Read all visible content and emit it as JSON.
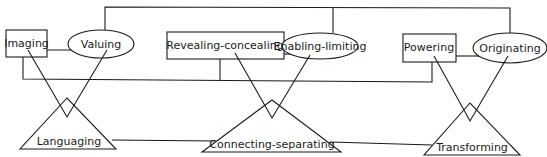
{
  "diagram": {
    "stroke_color": "#1a1a1a",
    "background": "#ffffff",
    "boxes": [
      {
        "id": "imaging",
        "label": "Imaging"
      },
      {
        "id": "revealing-concealing",
        "label": "Revealing-concealing"
      },
      {
        "id": "powering",
        "label": "Powering"
      }
    ],
    "ellipses": [
      {
        "id": "valuing",
        "label": "Valuing"
      },
      {
        "id": "enabling-limiting",
        "label": "Enabling-limiting"
      },
      {
        "id": "originating",
        "label": "Originating"
      }
    ],
    "triangles": [
      {
        "id": "languaging",
        "label": "Languaging"
      },
      {
        "id": "connecting-separating",
        "label": "Connecting-separating"
      },
      {
        "id": "transforming",
        "label": "Transforming"
      }
    ]
  }
}
